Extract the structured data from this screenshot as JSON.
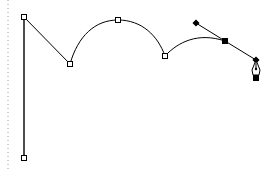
{
  "canvas": {
    "width": 272,
    "height": 172,
    "background": "#ffffff",
    "stroke_color": "#000000",
    "guide_color": "#9a9a9a"
  },
  "guide": {
    "type": "dotted-vertical-line",
    "x": 8
  },
  "path": {
    "anchors": [
      {
        "id": "a1",
        "x": 24,
        "y": 158,
        "type": "corner",
        "selected": false
      },
      {
        "id": "a2",
        "x": 24,
        "y": 17,
        "type": "corner",
        "selected": false
      },
      {
        "id": "a3",
        "x": 70,
        "y": 64,
        "type": "corner",
        "selected": false
      },
      {
        "id": "a4",
        "x": 118,
        "y": 20,
        "type": "smooth",
        "selected": false
      },
      {
        "id": "a5",
        "x": 165,
        "y": 56,
        "type": "corner",
        "selected": false
      },
      {
        "id": "a6",
        "x": 225,
        "y": 41,
        "type": "smooth",
        "selected": true
      }
    ],
    "active_handles": [
      {
        "x": 196,
        "y": 23
      },
      {
        "x": 256,
        "y": 60
      }
    ]
  },
  "cursor": {
    "tool": "pen-tool",
    "x": 256,
    "y": 60
  }
}
